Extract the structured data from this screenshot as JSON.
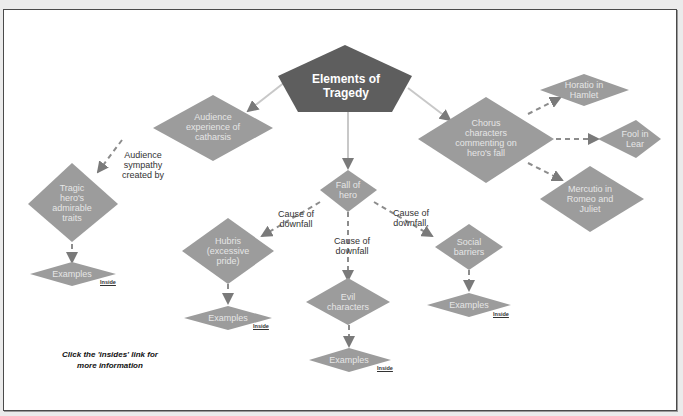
{
  "diagram": {
    "root": "Elements of Tragedy",
    "root_lines": [
      "Elements of",
      "Tragedy"
    ],
    "nodes": {
      "catharsis": [
        "Audience",
        "experience of",
        "catharsis"
      ],
      "chorus": [
        "Chorus",
        "characters",
        "commenting on",
        "hero's fall"
      ],
      "fall": [
        "Fall of",
        "hero"
      ],
      "tragic_hero": [
        "Tragic",
        "hero's",
        "admirable",
        "traits"
      ],
      "hubris": [
        "Hubris",
        "(excessive",
        "pride)"
      ],
      "evil": [
        "Evil",
        "characters"
      ],
      "social": [
        "Social",
        "barriers"
      ],
      "horatio": [
        "Horatio in",
        "Hamlet"
      ],
      "fool": [
        "Fool in",
        "Lear"
      ],
      "mercutio": [
        "Mercutio in",
        "Romeo and",
        "Juliet"
      ],
      "examples": "Examples"
    },
    "edge_labels": {
      "sympathy": [
        "Audience",
        "sympathy",
        "created by"
      ],
      "cause_left": [
        "Cause of",
        "downfall"
      ],
      "cause_mid": [
        "Cause of",
        "downfall"
      ],
      "cause_right": [
        "Cause of",
        "downfall,"
      ]
    },
    "link_label": "Inside",
    "note": [
      "Click the 'insides' link for",
      "more information"
    ]
  },
  "colors": {
    "root_fill": "#5e5e5e",
    "node_fill": "#9c9c9c",
    "node_text": "#e6e6e6",
    "solid_edge": "#c8c8c8",
    "dashed_edge": "#8c8c8c"
  }
}
